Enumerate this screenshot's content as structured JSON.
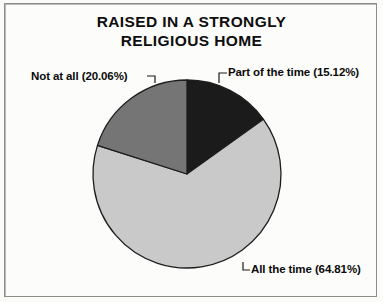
{
  "figure": {
    "title_line_1": "RAISED IN A STRONGLY",
    "title_line_2": "RELIGIOUS HOME",
    "background_color": "#fbfbf8",
    "border_color": "#8d8d8d"
  },
  "chart_data": {
    "type": "pie",
    "title": "RAISED IN A STRONGLY RELIGIOUS HOME",
    "xlabel": "",
    "ylabel": "",
    "grid": false,
    "legend_position": "callout-labels",
    "start_angle_deg": 90,
    "direction": "clockwise",
    "categories": [
      "Part of the time",
      "All the time",
      "Not at all"
    ],
    "values": [
      15.12,
      64.81,
      20.06
    ],
    "units": "percent",
    "slices": [
      {
        "label": "Part of the time",
        "value": 15.12,
        "value_text": "15.12%",
        "callout": "Part of the time (15.12%)",
        "color": "#1b1b1b",
        "start_deg": 0.0,
        "end_deg": 54.43
      },
      {
        "label": "All the time",
        "value": 64.81,
        "value_text": "64.81%",
        "callout": "All the time (64.81%)",
        "color": "#c9c9c9",
        "start_deg": 54.43,
        "end_deg": 287.75
      },
      {
        "label": "Not at all",
        "value": 20.06,
        "value_text": "20.06%",
        "callout": "Not at all (20.06%)",
        "color": "#757575",
        "start_deg": 287.75,
        "end_deg": 360.0
      }
    ],
    "geometry": {
      "center_x": 187,
      "center_y": 174,
      "radius": 94,
      "outline_color": "#1d1d1d"
    }
  }
}
